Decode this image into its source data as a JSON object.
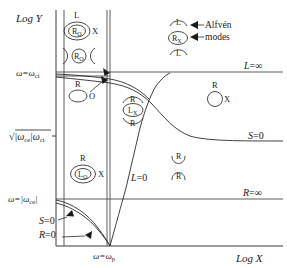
{
  "figure": {
    "type": "diagram"
  },
  "axes": {
    "y_label": "Log Y",
    "x_label": "Log X",
    "y_ticks": [
      {
        "id": "omega-ci",
        "label": "ω=ω",
        "sublabel": "ci",
        "y": 72
      },
      {
        "id": "sqrt-root",
        "label": "√",
        "inner": "|ω",
        "inner_sub": "ce",
        "inner2": "|ω",
        "inner2_sub": "ci",
        "y": 136
      },
      {
        "id": "omega-ce",
        "label": "ω=|ω",
        "sublabel": "ce",
        "label_end": "|",
        "y": 199
      }
    ],
    "x_ticks": [
      {
        "id": "omega-p",
        "label": "ω=ω",
        "sublabel": "p",
        "x": 109
      }
    ]
  },
  "boundary_labels": [
    {
      "id": "L-infinity",
      "text": "L",
      "eq": "=∞",
      "x": 244,
      "y": 69
    },
    {
      "id": "S-zero-right",
      "text": "S",
      "eq": "=0",
      "x": 248,
      "y": 141
    },
    {
      "id": "R-infinity",
      "text": "R",
      "eq": "=∞",
      "x": 243,
      "y": 196
    },
    {
      "id": "L-zero",
      "text": "L",
      "eq": "=0",
      "x": 131,
      "y": 181
    },
    {
      "id": "S-zero-left",
      "text": "S",
      "eq": "=0",
      "x": 42,
      "y": 221
    },
    {
      "id": "R-zero-left",
      "text": "R",
      "eq": "=0",
      "x": 42,
      "y": 235
    }
  ],
  "annotations": [
    {
      "id": "alfven",
      "text": "Alfvén",
      "x": 205,
      "y": 27
    },
    {
      "id": "modes",
      "text": "modes",
      "x": 205,
      "y": 39
    }
  ],
  "wave_icons": [
    {
      "id": "icon-RO-ellipse-top-left",
      "top_label": "L",
      "center_label": "R",
      "center_sub": "O",
      "right_label": "X",
      "shape": "ellipse-in-ellipse",
      "cx": 77,
      "cy": 31
    },
    {
      "id": "icon-RO-cones",
      "center_label": "R",
      "center_sub": "O",
      "shape": "circle-with-side-cones",
      "cx": 79,
      "cy": 56
    },
    {
      "id": "icon-R-O-oval",
      "top_label": "R",
      "right_label": "O",
      "shape": "oval",
      "cx": 78,
      "cy": 95
    },
    {
      "id": "icon-LX-with-R-arcs",
      "top_label": "R",
      "center_label": "L",
      "center_sub": "X",
      "bottom_label": "R",
      "shape": "ellipse-with-arcs",
      "cx": 133,
      "cy": 110
    },
    {
      "id": "icon-LO-ellipse",
      "top_label": "R",
      "center_label": "L",
      "center_sub": "O",
      "right_label": "X",
      "shape": "ellipse-in-ellipse",
      "cx": 83,
      "cy": 174
    },
    {
      "id": "icon-RX-alfven",
      "top_label": "L",
      "center_label": "R",
      "center_sub": "X",
      "bottom_label": "L",
      "shape": "ellipse-with-arcs",
      "cx": 178,
      "cy": 38
    },
    {
      "id": "icon-R-X-circle",
      "top_label": "R",
      "right_label": "X",
      "shape": "circle",
      "cx": 215,
      "cy": 98
    },
    {
      "id": "icon-R-arcs-lower-right",
      "top_label": "R",
      "bottom_label": "R",
      "shape": "two-arcs",
      "cx": 179,
      "cy": 168
    }
  ]
}
